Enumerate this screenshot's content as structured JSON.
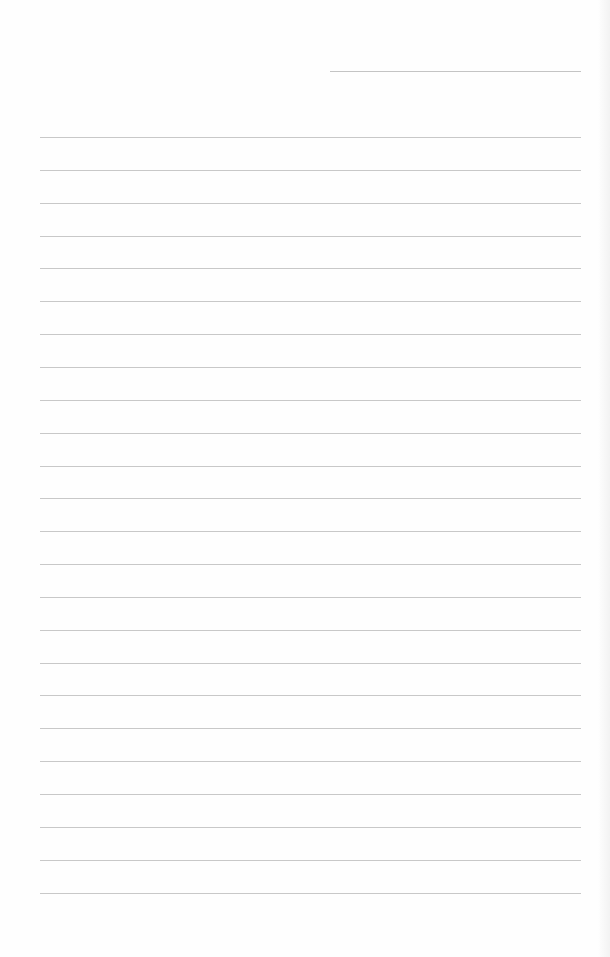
{
  "page": {
    "type": "lined-paper",
    "background_color": "#fefefe",
    "line_color": "#c8c8c8",
    "header_line": {
      "present": true,
      "label": ""
    },
    "rules": {
      "count": 24,
      "first_y": 137,
      "spacing": 32.85,
      "left": 40,
      "right": 581
    },
    "lines_text": [
      "",
      "",
      "",
      "",
      "",
      "",
      "",
      "",
      "",
      "",
      "",
      "",
      "",
      "",
      "",
      "",
      "",
      "",
      "",
      "",
      "",
      "",
      "",
      ""
    ]
  }
}
